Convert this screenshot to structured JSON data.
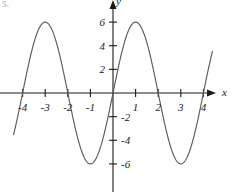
{
  "figure": {
    "tag": "5.",
    "background_color": "#ffffff",
    "curve_color": "#5a5a5a",
    "axis_color": "#1a1a1a"
  },
  "chart_data": {
    "type": "line",
    "title": "",
    "subtitle": "",
    "xlabel": "x",
    "ylabel": "y",
    "xlim": [
      -4.4,
      4.4
    ],
    "ylim": [
      -7.4,
      7.2
    ],
    "grid": false,
    "legend": null,
    "function": "y = 6 sin(pi x / 2)",
    "amplitude": 6,
    "period": 4,
    "x_ticks": [
      -4,
      -3,
      -2,
      -1,
      1,
      2,
      3,
      4
    ],
    "x_tick_labels": [
      "-4",
      "-3",
      "-2",
      "-1",
      "1",
      "2",
      "3",
      "4"
    ],
    "y_ticks": [
      6,
      4,
      2,
      -2,
      -4,
      -6
    ],
    "y_tick_labels": [
      "6",
      "4",
      "2",
      "-2",
      "-4",
      "-6"
    ],
    "y_tick_label_side": [
      "left",
      "left",
      "left",
      "right",
      "right",
      "right"
    ],
    "x_axis_arrow": true,
    "y_axis_arrow": true,
    "maxima": [
      {
        "x": -3,
        "y": 6
      },
      {
        "x": 1,
        "y": 6
      }
    ],
    "minima": [
      {
        "x": -1,
        "y": -6
      },
      {
        "x": 3,
        "y": -6
      }
    ],
    "zero_crossings": [
      -4,
      -2,
      0,
      2,
      4
    ],
    "series": [
      {
        "name": "y = 6 sin(pi x / 2)",
        "x": [
          -4.35,
          -4.2,
          -4.0,
          -3.8,
          -3.6,
          -3.4,
          -3.2,
          -3.0,
          -2.8,
          -2.6,
          -2.4,
          -2.2,
          -2.0,
          -1.8,
          -1.6,
          -1.4,
          -1.2,
          -1.0,
          -0.8,
          -0.6,
          -0.4,
          -0.2,
          0.0,
          0.2,
          0.4,
          0.6,
          0.8,
          1.0,
          1.2,
          1.4,
          1.6,
          1.8,
          2.0,
          2.2,
          2.4,
          2.6,
          2.8,
          3.0,
          3.2,
          3.4,
          3.6,
          3.8,
          4.0,
          4.2,
          4.35
        ],
        "y": [
          -3.1,
          -1.85,
          0.0,
          1.85,
          3.53,
          4.85,
          5.71,
          6.0,
          5.71,
          4.85,
          3.53,
          1.85,
          0.0,
          -1.85,
          -3.53,
          -4.85,
          -5.71,
          -6.0,
          -5.71,
          -4.85,
          -3.53,
          -1.85,
          0.0,
          1.85,
          3.53,
          4.85,
          5.71,
          6.0,
          5.71,
          4.85,
          3.53,
          1.85,
          0.0,
          -1.85,
          -3.53,
          -4.85,
          -5.71,
          -6.0,
          -5.71,
          -4.85,
          -3.53,
          -1.85,
          0.0,
          1.85,
          3.1
        ]
      }
    ]
  }
}
